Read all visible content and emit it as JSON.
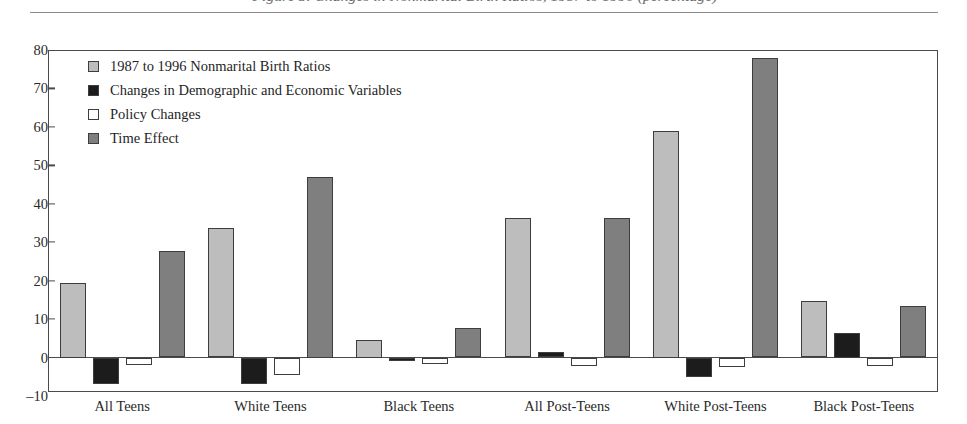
{
  "figure": {
    "title_partial": "Figure 3.  Changes in Nonmarital Birth Ratios, 1987 to 1996 (percentage)",
    "title_visible_note": "cropped-top-caption"
  },
  "chart_data": {
    "type": "bar",
    "title": "",
    "xlabel": "",
    "ylabel": "",
    "ylim": [
      -10,
      80
    ],
    "yticks": [
      -10,
      0,
      10,
      20,
      30,
      40,
      50,
      60,
      70,
      80
    ],
    "ytick_labels": [
      "–10",
      "0",
      "10",
      "20",
      "30",
      "40",
      "50",
      "60",
      "70",
      "80"
    ],
    "grid": false,
    "legend_position": "upper-left-inside",
    "categories": [
      "All Teens",
      "White Teens",
      "Black Teens",
      "All Post-Teens",
      "White Post-Teens",
      "Black Post-Teens"
    ],
    "series": [
      {
        "name": "1987 to 1996 Nonmarital Birth Ratios",
        "color": "#bdbdbd",
        "values": [
          19.5,
          33.6,
          4.5,
          36.2,
          59.0,
          14.8
        ]
      },
      {
        "name": "Changes in Demographic and Economic Variables",
        "color": "#1c1c1c",
        "values": [
          -7.0,
          -6.8,
          -1.0,
          1.4,
          -5.0,
          6.5
        ]
      },
      {
        "name": "Policy Changes",
        "color": "#ffffff",
        "values": [
          -2.0,
          -4.5,
          -1.6,
          -2.2,
          -2.6,
          -2.2
        ]
      },
      {
        "name": "Time Effect",
        "color": "#7f7f7f",
        "values": [
          27.6,
          47.0,
          7.8,
          36.4,
          77.9,
          13.3
        ]
      }
    ]
  },
  "colors": {
    "axis": "#4a4a4a",
    "bar_outline": "#3d3d3d",
    "text": "#1f1f1f",
    "rule": "#8a8a8a"
  }
}
